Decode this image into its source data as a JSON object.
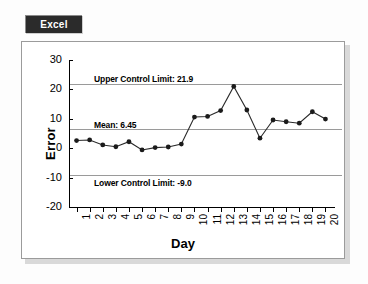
{
  "badge": {
    "label": "Excel"
  },
  "chart_data": {
    "type": "line",
    "title": "",
    "xlabel": "Day",
    "ylabel": "Error",
    "categories": [
      "1",
      "2",
      "3",
      "4",
      "5",
      "6",
      "7",
      "8",
      "9",
      "10",
      "11",
      "12",
      "13",
      "14",
      "15",
      "16",
      "17",
      "18",
      "19",
      "20"
    ],
    "values": [
      2.6,
      2.8,
      1.1,
      0.5,
      2.2,
      -0.6,
      0.2,
      0.4,
      1.4,
      10.6,
      10.8,
      12.8,
      21.0,
      13.0,
      3.4,
      9.6,
      9.0,
      8.5,
      12.4,
      9.9
    ],
    "series": [
      {
        "name": "Error",
        "values": [
          2.6,
          2.8,
          1.1,
          0.5,
          2.2,
          -0.6,
          0.2,
          0.4,
          1.4,
          10.6,
          10.8,
          12.8,
          21.0,
          13.0,
          3.4,
          9.6,
          9.0,
          8.5,
          12.4,
          9.9
        ]
      }
    ],
    "ylim": [
      -20,
      30
    ],
    "yticks": [
      30,
      20,
      10,
      0,
      -10,
      -20
    ],
    "ytick_labels": [
      "30",
      "20",
      "10",
      "0",
      "-10",
      "-20"
    ],
    "grid": false,
    "legend": "none",
    "marker": "filled-circle",
    "line_color": "#2a2a2a",
    "limit_line_color": "#9a9a9a",
    "annotations": [
      {
        "name": "upper-control-limit",
        "label": "Upper Control Limit: 21.9",
        "value": 21.9
      },
      {
        "name": "mean",
        "label": "Mean: 6.45",
        "value": 6.45
      },
      {
        "name": "lower-control-limit",
        "label": "Lower Control Limit: -9.0",
        "value": -9.0
      }
    ]
  }
}
